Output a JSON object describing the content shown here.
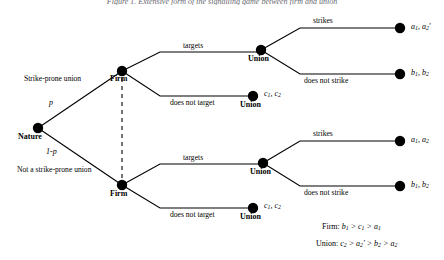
{
  "figure": {
    "caption_fragment": "Figure 1. Extensive form of the signalling game between firm and union",
    "background": "#ffffff",
    "ink": "#000000"
  },
  "nodes": {
    "nature": {
      "label": "Nature",
      "x": 38,
      "y": 128
    },
    "firm_top": {
      "label": "Firm",
      "x": 122,
      "y": 71
    },
    "firm_bottom": {
      "label": "Firm",
      "x": 122,
      "y": 185
    },
    "union_top": {
      "label": "Union",
      "x": 261,
      "y": 50
    },
    "union_top_nt": {
      "label": "Union",
      "x": 253,
      "y": 96
    },
    "union_bottom": {
      "label": "Union",
      "x": 263,
      "y": 163
    },
    "union_bottom_nt": {
      "label": "Union",
      "x": 253,
      "y": 208
    },
    "t_top_strike": {
      "x": 400,
      "y": 27
    },
    "t_top_nostrike": {
      "x": 400,
      "y": 73
    },
    "t_bottom_strike": {
      "x": 400,
      "y": 140
    },
    "t_bottom_nostrike": {
      "x": 400,
      "y": 185
    }
  },
  "probabilities": {
    "top": "p",
    "bottom": "1-p"
  },
  "nature_branches": {
    "top": "Strike-prone union",
    "bottom": "Not a strike-prone union"
  },
  "firm_actions": {
    "target": "targets",
    "no_target": "does not target"
  },
  "union_actions": {
    "strike": "strikes",
    "no_strike": "does not strike"
  },
  "payoffs": {
    "top_strike": {
      "firm": "a",
      "firm_sub": "1",
      "union": "a",
      "union_sub": "2",
      "union_prime": true
    },
    "top_nostrike": {
      "firm": "b",
      "firm_sub": "1",
      "union": "b",
      "union_sub": "2",
      "union_prime": false
    },
    "top_notarget": {
      "firm": "c",
      "firm_sub": "1",
      "union": "c",
      "union_sub": "2",
      "union_prime": false
    },
    "bottom_strike": {
      "firm": "a",
      "firm_sub": "1",
      "union": "a",
      "union_sub": "2",
      "union_prime": false
    },
    "bottom_nostrike": {
      "firm": "b",
      "firm_sub": "1",
      "union": "b",
      "union_sub": "2",
      "union_prime": false
    },
    "bottom_notarget": {
      "firm": "c",
      "firm_sub": "1",
      "union": "c",
      "union_sub": "2",
      "union_prime": false
    }
  },
  "legend": {
    "firm_label": "Firm:",
    "firm_ordering": "b1 > c1 > a1",
    "union_label": "Union:",
    "union_ordering": "c2 > a2' > b2 > a2"
  },
  "info_set": {
    "description": "dashed line connecting the two Firm nodes",
    "x": 122,
    "y_top": 78,
    "y_bottom": 178
  }
}
